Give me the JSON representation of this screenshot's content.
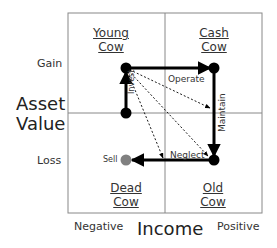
{
  "quadrants": {
    "top_left": [
      "Young",
      "Cow"
    ],
    "top_right": [
      "Cash",
      "Cow"
    ],
    "bottom_left": [
      "Dead",
      "Cow"
    ],
    "bottom_right": [
      "Old",
      "Cow"
    ]
  },
  "y_axis": {
    "title_line1": "Asset",
    "title_line2": "Value",
    "high": "Gain",
    "low": "Loss"
  },
  "x_axis": {
    "title": "Income",
    "low": "Negative",
    "high": "Positive"
  },
  "transitions": {
    "invest": "Invest",
    "operate": "Operate",
    "maintain": "Maintain",
    "neglect": "Neglect",
    "sell": "Sell"
  },
  "colors": {
    "arrow": "#000000",
    "grid": "#888888",
    "sell_dot": "#808080"
  }
}
